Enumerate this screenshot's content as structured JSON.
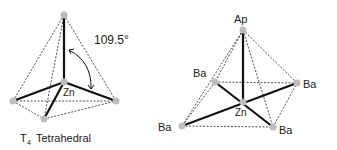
{
  "left_diagram": {
    "caption_prefix": "T",
    "caption_subscript": "4",
    "caption_text": "Tetrahedral",
    "center_label": "Zn",
    "angle_label": "109.5°"
  },
  "right_diagram": {
    "apex_label": "Ap",
    "center_label": "Zn",
    "basal_labels": [
      "Ba",
      "Ba",
      "Ba",
      "Ba"
    ]
  },
  "colors": {
    "bond": "#111111",
    "edge_dashed": "#222222",
    "atom": "#bdbdbd"
  }
}
